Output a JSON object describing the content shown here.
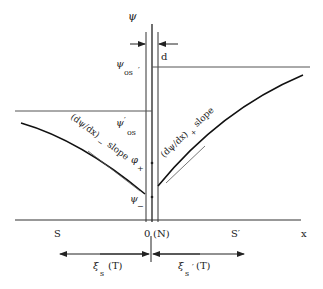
{
  "diagram": {
    "y_axis_label": "ψ",
    "psi_os_prime_top": {
      "main": "ψ",
      "sub": "os",
      "prime": "′"
    },
    "psi_os_prime_mid": {
      "main": "ψ",
      "sup": "′",
      "sub": "os"
    },
    "d_label": "d",
    "slope_minus": {
      "text": "(dψ/dx)",
      "sub": "−",
      "word": "slope"
    },
    "slope_plus": {
      "text": "(dψ/dx)",
      "sub": "+",
      "word": "slope"
    },
    "phi_plus": {
      "main": "φ",
      "sub": "+"
    },
    "phi_minus": {
      "main": "ψ",
      "sub": "−"
    },
    "x_labels": {
      "S": "S",
      "origin": "0",
      "N": "(N)",
      "S_prime": "S′",
      "x": "x"
    },
    "xi_left": {
      "main": "ξ",
      "sub": "s",
      "arg": "(T)"
    },
    "xi_right": {
      "main": "ξ",
      "sub": "s",
      "prime": "′",
      "arg": "(T)"
    }
  }
}
